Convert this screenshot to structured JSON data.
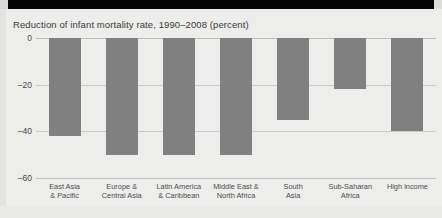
{
  "chart_data": {
    "type": "bar",
    "title": "Reduction of infant mortality rate, 1990–2008 (percent)",
    "xlabel": "",
    "ylabel": "",
    "ylim": [
      -60,
      0
    ],
    "yticks": [
      0,
      -20,
      -40,
      -60
    ],
    "ytick_labels": [
      "0",
      "–20",
      "–40",
      "–60"
    ],
    "grid": true,
    "legend": "none",
    "bar_color": "#808080",
    "categories": [
      "East Asia & Pacific",
      "Europe & Central Asia",
      "Latin America & Caribbean",
      "Middle East & North Africa",
      "South Asia",
      "Sub-Saharan Africa",
      "High income"
    ],
    "category_lines": [
      [
        "East Asia",
        "& Pacific"
      ],
      [
        "Europe &",
        "Central Asia"
      ],
      [
        "Latin America",
        "& Caribbean"
      ],
      [
        "Middle East &",
        "North Africa"
      ],
      [
        "South",
        "Asia"
      ],
      [
        "Sub-Saharan",
        "Africa"
      ],
      [
        "High income"
      ]
    ],
    "values": [
      -42,
      -50,
      -50,
      -50,
      -35,
      -22,
      -40
    ]
  },
  "colors": {
    "bar": "#808080",
    "background": "#ededec",
    "banner": "#050505",
    "gridline": "#c9c9c7",
    "text": "#3a3a3a"
  }
}
